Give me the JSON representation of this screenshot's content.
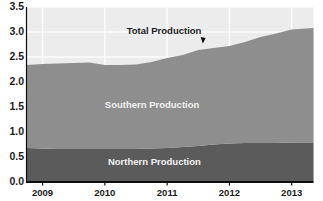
{
  "chart_data": {
    "type": "area",
    "stacked": true,
    "title": "",
    "subtitle": "",
    "xlabel": "",
    "ylabel": "",
    "xlim": [
      2008.75,
      2013.35
    ],
    "ylim": [
      0.0,
      3.5
    ],
    "grid": true,
    "legend_position": "inline-annotations",
    "y_ticks": [
      "3.5",
      "3.0",
      "2.5",
      "2.0",
      "1.5",
      "1.0",
      "0.5",
      "0.0"
    ],
    "y_tick_values": [
      3.5,
      3.0,
      2.5,
      2.0,
      1.5,
      1.0,
      0.5,
      0.0
    ],
    "x_ticks": [
      "2009",
      "2010",
      "2011",
      "2012",
      "2013"
    ],
    "x_tick_values": [
      2009,
      2010,
      2011,
      2012,
      2013
    ],
    "annotations": [
      {
        "text": "Total Production",
        "x": 2010.35,
        "y": 3.02,
        "color": "#1b1b1b",
        "pointer": true
      },
      {
        "text": "Southern Production",
        "x": 2010.0,
        "y": 1.55,
        "color": "#f2f2f2",
        "pointer": false
      },
      {
        "text": "Northern Production",
        "x": 2010.05,
        "y": 0.4,
        "color": "#f2f2f2",
        "pointer": false
      }
    ],
    "x": [
      2008.75,
      2009.0,
      2009.25,
      2009.5,
      2009.75,
      2010.0,
      2010.25,
      2010.5,
      2010.75,
      2011.0,
      2011.25,
      2011.5,
      2011.75,
      2012.0,
      2012.25,
      2012.5,
      2012.75,
      2013.0,
      2013.35
    ],
    "series": [
      {
        "name": "Northern Production",
        "color": "#5b5b5b",
        "values": [
          0.68,
          0.67,
          0.66,
          0.66,
          0.66,
          0.66,
          0.66,
          0.66,
          0.67,
          0.68,
          0.7,
          0.72,
          0.75,
          0.77,
          0.78,
          0.78,
          0.78,
          0.79,
          0.79
        ]
      },
      {
        "name": "Southern Production",
        "color": "#8e8e8e",
        "values": [
          1.66,
          1.69,
          1.71,
          1.72,
          1.73,
          1.68,
          1.68,
          1.69,
          1.73,
          1.8,
          1.84,
          1.92,
          1.93,
          1.95,
          2.02,
          2.12,
          2.19,
          2.26,
          2.29
        ]
      }
    ],
    "total": {
      "name": "Total Production",
      "values": [
        2.34,
        2.36,
        2.37,
        2.38,
        2.39,
        2.34,
        2.34,
        2.35,
        2.4,
        2.48,
        2.54,
        2.64,
        2.68,
        2.72,
        2.8,
        2.9,
        2.97,
        3.05,
        3.08
      ]
    },
    "colors": {
      "northern": "#5b5b5b",
      "southern": "#8e8e8e",
      "plot_background": "#ececec",
      "gridline": "#fdfdfd",
      "axis": "#0d0d0d",
      "page_background": "#ffffff"
    }
  }
}
